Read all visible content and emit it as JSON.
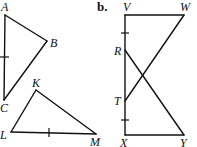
{
  "figure_a": {
    "triangle_abc": {
      "vertices": {
        "A": "A",
        "B": "B",
        "C": "C"
      },
      "congruence_marks": [
        "AC"
      ]
    },
    "triangle_klm": {
      "vertices": {
        "K": "K",
        "L": "L",
        "M": "M"
      },
      "congruence_marks": [
        "LM"
      ]
    }
  },
  "figure_b": {
    "part_label": "b.",
    "points": {
      "V": "V",
      "W": "W",
      "R": "R",
      "T": "T",
      "X": "X",
      "Y": "Y"
    },
    "segments": [
      "VW",
      "VX",
      "XY",
      "WT",
      "RY"
    ],
    "congruence_marks": [
      "VR",
      "TX"
    ]
  }
}
